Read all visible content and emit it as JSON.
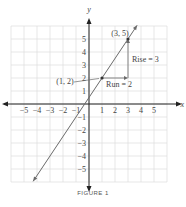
{
  "chart_data": {
    "type": "line",
    "title": "",
    "caption": "FIGURE 1",
    "xlabel": "x",
    "ylabel": "y",
    "xlim": [
      -6,
      6
    ],
    "ylim": [
      -6,
      6
    ],
    "grid": true,
    "x_ticks": [
      "-5",
      "-4",
      "-3",
      "-2",
      "-1",
      "1",
      "2",
      "3",
      "4",
      "5"
    ],
    "y_ticks": [
      "5",
      "4",
      "3",
      "2",
      "1",
      "-1",
      "-2",
      "-3",
      "-4",
      "-5"
    ],
    "series": [
      {
        "name": "line y = (3/2)x + 1/2",
        "x": [
          -4.3,
          3.7
        ],
        "y": [
          -5.95,
          6.05
        ]
      }
    ],
    "points": [
      {
        "label": "(1, 2)",
        "x": 1,
        "y": 2
      },
      {
        "label": "(3, 5)",
        "x": 3,
        "y": 5
      }
    ],
    "annotations": [
      {
        "text": "Run = 2",
        "from": [
          1,
          2
        ],
        "to": [
          3,
          2
        ]
      },
      {
        "text": "Rise = 3",
        "from": [
          3,
          2
        ],
        "to": [
          3,
          5
        ]
      }
    ],
    "colors": {
      "line": "#6a6a6a",
      "axis": "#222222",
      "grid": "#dddddd",
      "text": "#444444"
    }
  }
}
